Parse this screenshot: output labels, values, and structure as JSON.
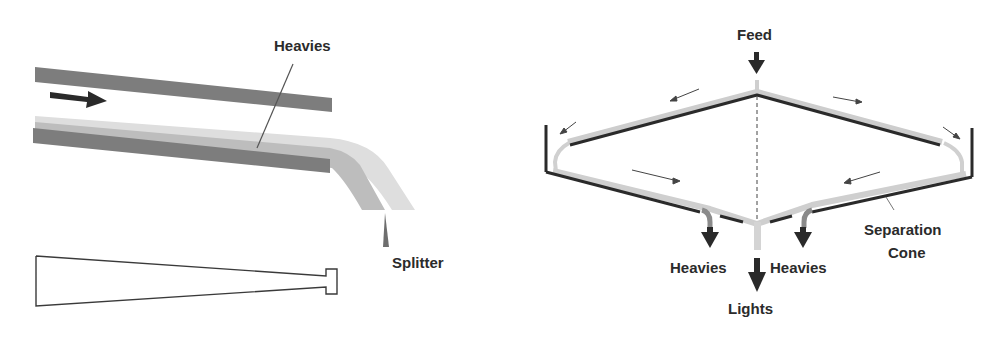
{
  "left_diagram": {
    "labels": {
      "heavies": "Heavies",
      "splitter": "Splitter"
    },
    "colors": {
      "wall": "#7a7a7a",
      "heavy_layer": "#b4b4b4",
      "light_layer": "#dcdcdc",
      "arrow": "#2a2a2a"
    }
  },
  "right_diagram": {
    "labels": {
      "feed": "Feed",
      "heavies_left": "Heavies",
      "heavies_right": "Heavies",
      "lights": "Lights",
      "separation_cone_line1": "Separation",
      "separation_cone_line2": "Cone"
    },
    "colors": {
      "cone": "#2a2a2a",
      "film": "#c8c8c8",
      "heavy_outlet": "#8c8c8c",
      "arrow": "#2a2a2a"
    }
  }
}
